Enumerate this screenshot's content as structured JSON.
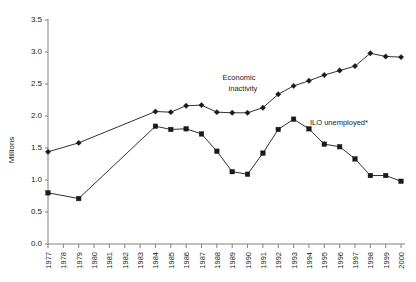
{
  "chart_data": {
    "type": "line",
    "title": "",
    "xlabel": "",
    "ylabel": "Millions",
    "ylim": [
      0.0,
      3.5
    ],
    "ytick_labels": [
      "0.0",
      "0.5",
      "1.0",
      "1.5",
      "2.0",
      "2.5",
      "3.0",
      "3.5"
    ],
    "ytick_values": [
      0.0,
      0.5,
      1.0,
      1.5,
      2.0,
      2.5,
      3.0,
      3.5
    ],
    "grid": false,
    "legend_position": "inline-annotations",
    "categories": [
      "1977",
      "1978",
      "1979",
      "1980",
      "1981",
      "1982",
      "1983",
      "1984",
      "1985",
      "1986",
      "1987",
      "1988",
      "1989",
      "1990",
      "1991",
      "1992",
      "1993",
      "1994",
      "1995",
      "1996",
      "1997",
      "1998",
      "1999",
      "2000"
    ],
    "series": [
      {
        "name": "Economic inactivity",
        "marker": "diamond",
        "x": [
          "1977",
          "1979",
          "1984",
          "1985",
          "1986",
          "1987",
          "1988",
          "1989",
          "1990",
          "1991",
          "1992",
          "1993",
          "1994",
          "1995",
          "1996",
          "1997",
          "1998",
          "1999",
          "2000"
        ],
        "values": [
          1.44,
          1.58,
          2.07,
          2.06,
          2.16,
          2.17,
          2.06,
          2.05,
          2.05,
          2.13,
          2.34,
          2.47,
          2.55,
          2.64,
          2.71,
          2.78,
          2.98,
          2.93,
          2.92
        ]
      },
      {
        "name": "ILO unemployed*",
        "marker": "square",
        "x": [
          "1977",
          "1979",
          "1984",
          "1985",
          "1986",
          "1987",
          "1988",
          "1989",
          "1990",
          "1991",
          "1992",
          "1993",
          "1994",
          "1995",
          "1996",
          "1997",
          "1998",
          "1999",
          "2000"
        ],
        "values": [
          0.8,
          0.71,
          1.84,
          1.79,
          1.8,
          1.72,
          1.45,
          1.13,
          1.09,
          1.42,
          1.79,
          1.95,
          1.8,
          1.56,
          1.52,
          1.33,
          1.07,
          1.07,
          0.98
        ]
      }
    ],
    "annotations": [
      {
        "text": "Economic",
        "x": 239,
        "y": 80
      },
      {
        "text": "inactivity",
        "x": 243,
        "y": 91
      },
      {
        "text": "ILO unemployed*",
        "x": 310,
        "y": 125
      }
    ]
  }
}
